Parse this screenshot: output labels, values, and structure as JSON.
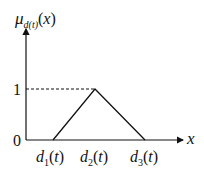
{
  "diagram": {
    "type": "triangular-membership-function",
    "y_axis_label": {
      "main": "μ",
      "sub": "d(t)",
      "arg": "(x)"
    },
    "x_axis_label": "x",
    "y_ticks": [
      "1",
      "0"
    ],
    "x_ticks": [
      {
        "main": "d",
        "sub": "1",
        "arg": "(t)"
      },
      {
        "main": "d",
        "sub": "2",
        "arg": "(t)"
      },
      {
        "main": "d",
        "sub": "3",
        "arg": "(t)"
      }
    ],
    "points": [
      [
        0,
        0
      ],
      [
        1,
        1
      ],
      [
        2,
        0
      ]
    ],
    "line_color": "#111111"
  }
}
